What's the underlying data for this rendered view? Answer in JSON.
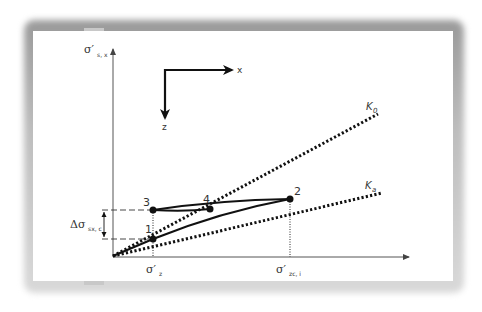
{
  "figure": {
    "axes": {
      "y_label_main": "σ′",
      "y_label_sub": "s, x",
      "x_tick_1_main": "σ′",
      "x_tick_1_sub": "z",
      "x_tick_2_main": "σ′",
      "x_tick_2_sub": "zc, i"
    },
    "inset": {
      "x_label": "x",
      "z_label": "z"
    },
    "lines": {
      "k0_label": "K",
      "k0_sub": "0",
      "ka_label": "K",
      "ka_sub": "a"
    },
    "delta": {
      "label_main": "Δσ",
      "label_sub": "sx, c"
    },
    "points": [
      {
        "id": "1",
        "label": "1"
      },
      {
        "id": "2",
        "label": "2"
      },
      {
        "id": "3",
        "label": "3"
      },
      {
        "id": "4",
        "label": "4"
      }
    ],
    "colors": {
      "ink": "#111111",
      "axis": "#555555",
      "text": "#333333",
      "frame_shadow": "#9a9a9a"
    }
  }
}
